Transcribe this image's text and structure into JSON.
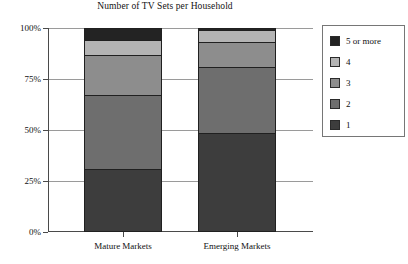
{
  "chart_data": {
    "type": "bar",
    "stacked": true,
    "stacked_mode": "percent",
    "title": "Number of TV Sets per Household",
    "xlabel": "",
    "ylabel": "",
    "categories": [
      "Mature Markets",
      "Emerging Markets"
    ],
    "ylim": [
      0,
      100
    ],
    "ytick_values": [
      0,
      25,
      50,
      75,
      100
    ],
    "ytick_labels": [
      "0%",
      "25%",
      "50%",
      "75%",
      "100%"
    ],
    "grid": true,
    "grid_axis": "y",
    "legend_position": "right",
    "series": [
      {
        "name": "1",
        "color": "#3d3d3d",
        "values": [
          31,
          48.6
        ]
      },
      {
        "name": "2",
        "color": "#6e6e6e",
        "values": [
          36,
          32.4
        ]
      },
      {
        "name": "3",
        "color": "#8d8d8d",
        "values": [
          20,
          12
        ]
      },
      {
        "name": "4",
        "color": "#b4b4b4",
        "values": [
          7,
          6
        ]
      },
      {
        "name": "5 or more",
        "color": "#232323",
        "values": [
          6,
          1
        ]
      }
    ],
    "legend_entries": [
      {
        "label": "5 or more",
        "color": "#232323"
      },
      {
        "label": "4",
        "color": "#b4b4b4"
      },
      {
        "label": "3",
        "color": "#8d8d8d"
      },
      {
        "label": "2",
        "color": "#6e6e6e"
      },
      {
        "label": "1",
        "color": "#3d3d3d"
      }
    ]
  },
  "axis": {
    "y_labels": {
      "t100": "100%",
      "t75": "75%",
      "t50": "50%",
      "t25": "25%",
      "t0": "0%"
    },
    "x_labels": {
      "mature": "Mature Markets",
      "emerging": "Emerging Markets"
    }
  },
  "legend": {
    "items": [
      {
        "label": "5 or more"
      },
      {
        "label": "4"
      },
      {
        "label": "3"
      },
      {
        "label": "2"
      },
      {
        "label": "1"
      }
    ]
  },
  "title": "Number of TV Sets per Household"
}
